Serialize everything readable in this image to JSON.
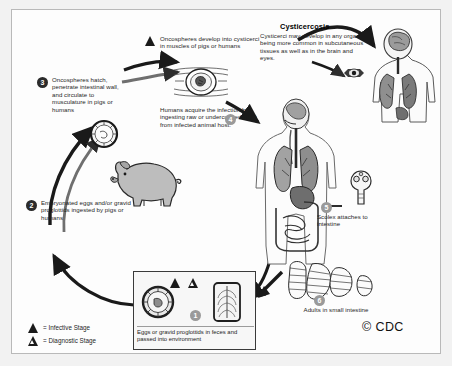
{
  "figure": {
    "credit": "© CDC",
    "background_color": "#f2f2f2",
    "plate_color": "#fdfdfd",
    "ink_color": "#1a1a1a"
  },
  "cysticercosis_panel": {
    "heading": "Cysticercosis",
    "body": "Cysticerci may develop in any organ, being more common in subcutaneous tissues as well as in the brain and eyes."
  },
  "annotations": {
    "oncospheres_develop": "Oncospheres develop into cysticerci in muscles of pigs or humans",
    "humans_acquire": "Humans acquire the infection by ingesting raw or undercooked meat from infected animal host.",
    "scolex": "Scolex attaches to intestine",
    "adults": "Adults in small intestine"
  },
  "steps": [
    {
      "number": "1",
      "label": "",
      "style": "light"
    },
    {
      "number": "2",
      "label": "Embryonated eggs and/or gravid proglottids ingested by pigs or humans",
      "style": "dark"
    },
    {
      "number": "3",
      "label": "Oncospheres hatch, penetrate intestinal wall, and circulate to musculature in pigs or humans",
      "style": "dark"
    },
    {
      "number": "4",
      "label": "",
      "style": "light"
    },
    {
      "number": "5",
      "label": "Scolex attaches to intestine",
      "style": "light"
    },
    {
      "number": "6",
      "label": "Adults in small intestine",
      "style": "light"
    }
  ],
  "inset": {
    "caption": "Eggs or gravid proglottids in feces and passed into environment",
    "marker": "1",
    "icons": [
      "infective-triangle",
      "diagnostic-triangle"
    ],
    "drawings": [
      "taenia-egg",
      "gravid-proglottid"
    ]
  },
  "legend": {
    "items": [
      {
        "icon": "infective-triangle",
        "label": "= Infective Stage"
      },
      {
        "icon": "diagnostic-triangle",
        "label": "= Diagnostic Stage"
      }
    ]
  },
  "illustrations": {
    "pig": "pig-drawing",
    "oncosphere": "oncosphere-egg-drawing",
    "cysticercus_muscle": "cysticercus-in-muscle-drawing",
    "human_torso": "human-torso-anatomy-drawing",
    "human_upper": "human-head-lungs-anatomy-drawing",
    "eye": "eye-cysticercus-drawing",
    "scolex": "scolex-drawing",
    "adult_worm": "adult-tapeworm-drawing"
  }
}
